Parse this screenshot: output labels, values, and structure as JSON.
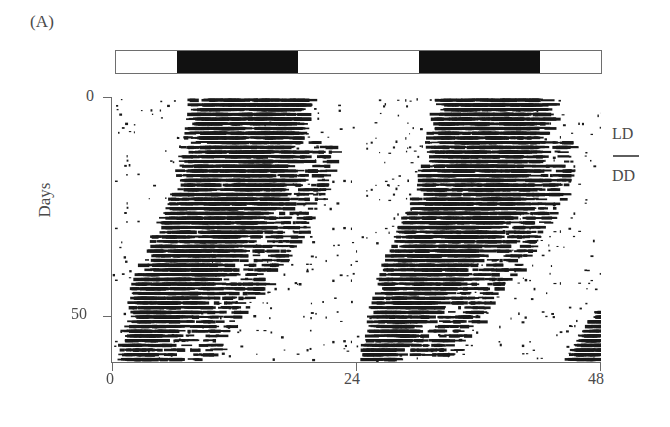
{
  "figure": {
    "panel_label": "(A)",
    "type": "double-plotted actogram"
  },
  "axes": {
    "y_title": "Days",
    "y_ticks": [
      "0",
      "50"
    ],
    "x_ticks": [
      "0",
      "24",
      "48"
    ]
  },
  "legend": {
    "ld_label": "LD",
    "dd_label": "DD"
  },
  "ld_bar": {
    "segments": [
      {
        "phase": "light",
        "start_h": 0,
        "end_h": 6
      },
      {
        "phase": "dark",
        "start_h": 6,
        "end_h": 18
      },
      {
        "phase": "light",
        "start_h": 18,
        "end_h": 30
      },
      {
        "phase": "dark",
        "start_h": 30,
        "end_h": 42
      },
      {
        "phase": "light",
        "start_h": 42,
        "end_h": 48
      }
    ]
  },
  "colors": {
    "ink": "#4b4b4b",
    "axis": "#6a6a6a",
    "dark_phase": "#111111",
    "light_phase": "#ffffff",
    "activity": "#1a1a1a",
    "background": "#ffffff"
  },
  "chart_data": {
    "type": "scatter",
    "title": "",
    "subtitle": "",
    "xlabel": "",
    "ylabel": "Days",
    "xlim": [
      0,
      48
    ],
    "ylim": [
      0,
      56
    ],
    "y_inverted": true,
    "grid": false,
    "legend_position": "right",
    "x_tick_values": [
      0,
      24,
      48
    ],
    "y_tick_values": [
      0,
      50
    ],
    "double_plot": true,
    "plot_period_h": 24,
    "n_days": 56,
    "lighting_schedule": [
      {
        "condition": "LD",
        "day_start": 0,
        "day_end": 20,
        "lights_off_h": 6,
        "lights_on_h": 18
      },
      {
        "condition": "DD",
        "day_start": 20,
        "day_end": 56
      }
    ],
    "activity_band": {
      "description": "Main locomotor activity bout; entrained to lights-off under LD then free-runs with period slightly longer than 24 h under DD",
      "onset_h_by_day": [
        7.4,
        7.3,
        7.2,
        7.1,
        7.1,
        7.0,
        6.9,
        6.9,
        6.8,
        6.8,
        6.7,
        6.6,
        6.5,
        6.4,
        6.2,
        6.1,
        6.0,
        5.9,
        5.8,
        5.7,
        5.5,
        5.3,
        5.1,
        4.9,
        4.7,
        4.5,
        4.3,
        4.1,
        3.9,
        3.7,
        3.5,
        3.3,
        3.1,
        2.9,
        2.7,
        2.5,
        2.3,
        2.1,
        1.9,
        1.8,
        1.7,
        1.6,
        1.5,
        1.4,
        1.3,
        1.2,
        1.1,
        1.0,
        0.9,
        0.8,
        0.7,
        0.6,
        0.5,
        0.4,
        0.3,
        0.2
      ],
      "offset_h_by_day": [
        19.0,
        18.9,
        18.8,
        18.8,
        18.7,
        18.6,
        18.6,
        18.5,
        18.4,
        18.4,
        18.3,
        18.2,
        18.1,
        18.0,
        17.9,
        17.7,
        17.6,
        17.5,
        17.3,
        17.2,
        17.0,
        16.8,
        16.5,
        16.2,
        15.9,
        15.6,
        15.3,
        15.0,
        14.6,
        14.2,
        13.8,
        13.4,
        13.0,
        12.6,
        12.2,
        11.8,
        11.4,
        11.0,
        10.6,
        10.2,
        9.8,
        9.4,
        9.0,
        8.6,
        8.2,
        7.8,
        7.4,
        7.0,
        6.6,
        6.2,
        5.8,
        5.4,
        5.0,
        4.6,
        4.2,
        3.8
      ],
      "density": 0.74
    },
    "scattered_activity": {
      "description": "Sparse low-amplitude activity marks outside the main band",
      "density": 0.035
    },
    "free_run_period_h": 24.45,
    "transition_day_ld_to_dd": 20
  }
}
